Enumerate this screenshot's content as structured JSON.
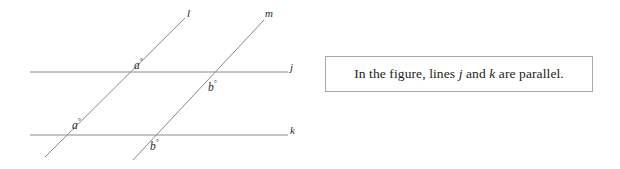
{
  "figure": {
    "name": "parallel-lines-transversals-diagram",
    "line_color": "#8a8a8a",
    "text_color": "#2b2b2b",
    "labels": {
      "line_l": "l",
      "line_m": "m",
      "line_j": "j",
      "line_k": "k"
    },
    "angles": {
      "a_upper_var": "a",
      "a_upper_deg": "°",
      "a_lower_var": "a",
      "a_lower_deg": "°",
      "b_upper_var": "b",
      "b_upper_deg": "°",
      "b_lower_var": "b",
      "b_lower_deg": "°"
    },
    "geometry": {
      "line_j": {
        "x1": 30,
        "y1": 72,
        "x2": 288,
        "y2": 72
      },
      "line_k": {
        "x1": 30,
        "y1": 135,
        "x2": 288,
        "y2": 135
      },
      "line_l": {
        "x1": 45,
        "y1": 157,
        "x2": 185,
        "y2": 18
      },
      "line_m": {
        "x1": 133,
        "y1": 160,
        "x2": 264,
        "y2": 20
      }
    }
  },
  "caption": {
    "border_color": "#a9a9a9",
    "text_before_j": "In the figure, lines ",
    "var_j": "j",
    "text_between": " and ",
    "var_k": "k",
    "text_after_k": " are parallel."
  }
}
